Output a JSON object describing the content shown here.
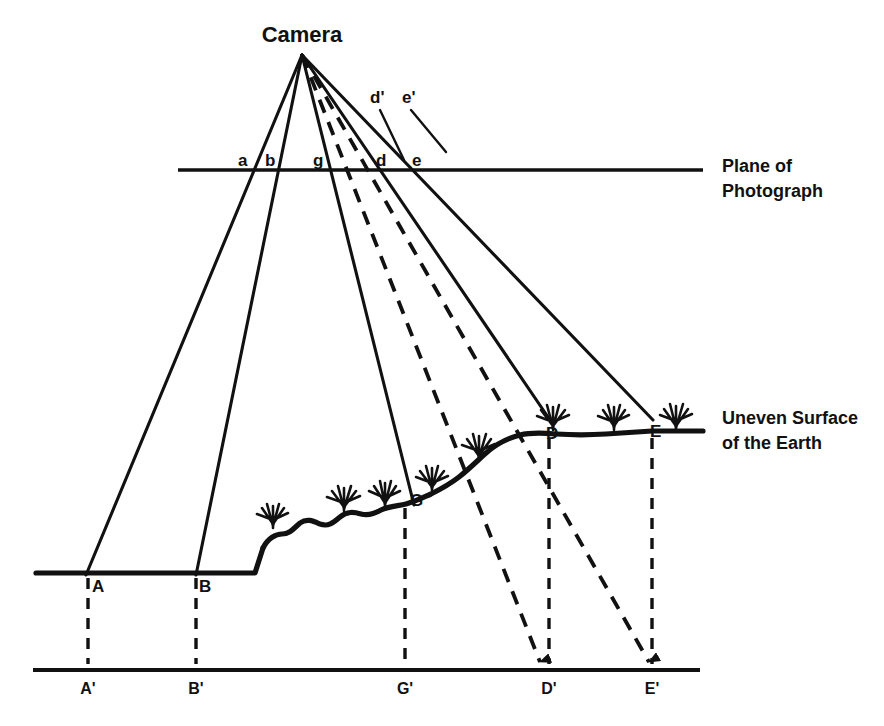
{
  "figure": {
    "background_color": "#ffffff",
    "ink_color": "#111111"
  },
  "annotations": {
    "camera": "Camera",
    "plane_of_photograph_line1": "Plane of",
    "plane_of_photograph_line2": "Photograph",
    "uneven_surface_line1": "Uneven Surface",
    "uneven_surface_line2": "of the Earth"
  },
  "photo_plane_points": [
    {
      "id": "a",
      "label": "a",
      "x": 243,
      "y": 166
    },
    {
      "id": "b",
      "label": "b",
      "x": 270,
      "y": 166
    },
    {
      "id": "g",
      "label": "g",
      "x": 318,
      "y": 166
    },
    {
      "id": "d",
      "label": "d",
      "x": 381,
      "y": 166
    },
    {
      "id": "e",
      "label": "e",
      "x": 417,
      "y": 166
    },
    {
      "id": "d-prime",
      "label": "d'",
      "x": 376,
      "y": 102
    },
    {
      "id": "e-prime",
      "label": "e'",
      "x": 407,
      "y": 102
    }
  ],
  "ground_points": [
    {
      "id": "A",
      "label": "A",
      "x": 92,
      "y": 589
    },
    {
      "id": "B",
      "label": "B",
      "x": 199,
      "y": 589
    },
    {
      "id": "G",
      "label": "G",
      "x": 412,
      "y": 503
    },
    {
      "id": "D",
      "label": "D",
      "x": 548,
      "y": 435
    },
    {
      "id": "E",
      "label": "E",
      "x": 651,
      "y": 433
    }
  ],
  "datum_points": [
    {
      "id": "A-prime",
      "label": "A'",
      "x": 88,
      "y": 692
    },
    {
      "id": "B-prime",
      "label": "B'",
      "x": 196,
      "y": 692
    },
    {
      "id": "G-prime",
      "label": "G'",
      "x": 404,
      "y": 692
    },
    {
      "id": "D-prime",
      "label": "D'",
      "x": 540,
      "y": 692
    },
    {
      "id": "E-prime",
      "label": "E'",
      "x": 650,
      "y": 692
    }
  ],
  "geometry": {
    "camera_apex": {
      "x": 302,
      "y": 55
    },
    "photo_plane_y": 170,
    "photo_plane_x_start": 178,
    "photo_plane_x_end": 703,
    "datum_y": 670,
    "datum_x_start": 33,
    "datum_x_end": 700,
    "left_ground_y": 573,
    "left_ground_x_start": 36,
    "terrain_step_x": 262
  }
}
